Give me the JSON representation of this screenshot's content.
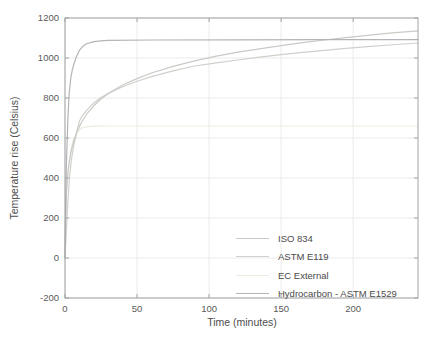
{
  "chart_data": {
    "type": "line",
    "title": "",
    "xlabel": "Time (minutes)",
    "ylabel": "Temperature rise (Celsius)",
    "xlim": [
      0,
      245
    ],
    "ylim": [
      -200,
      1200
    ],
    "xticks": [
      0,
      50,
      100,
      150,
      200
    ],
    "yticks": [
      -200,
      0,
      200,
      400,
      600,
      800,
      1000,
      1200
    ],
    "grid": true,
    "legend_position": "inside-bottom-right",
    "colors": {
      "axis": "#a3a3a3",
      "grid": "#ebebeb",
      "tick_label": "#5a5a5a",
      "axis_label": "#4d4d4d",
      "legend_text": "#4a4a4a",
      "background": "#ffffff"
    },
    "series": [
      {
        "name": "ISO 834",
        "color": "#c7cbc7",
        "points": [
          [
            0,
            0
          ],
          [
            0.5,
            195
          ],
          [
            1,
            329
          ],
          [
            1.5,
            384
          ],
          [
            2,
            425
          ],
          [
            3,
            482
          ],
          [
            4,
            525
          ],
          [
            5,
            556
          ],
          [
            6,
            583
          ],
          [
            8,
            625
          ],
          [
            10,
            658
          ],
          [
            12,
            685
          ],
          [
            15,
            719
          ],
          [
            20,
            761
          ],
          [
            25,
            795
          ],
          [
            30,
            822
          ],
          [
            40,
            865
          ],
          [
            50,
            897
          ],
          [
            60,
            925
          ],
          [
            75,
            958
          ],
          [
            90,
            986
          ],
          [
            105,
            1009
          ],
          [
            120,
            1029
          ],
          [
            135,
            1046
          ],
          [
            150,
            1062
          ],
          [
            165,
            1077
          ],
          [
            180,
            1090
          ],
          [
            195,
            1102
          ],
          [
            210,
            1113
          ],
          [
            225,
            1124
          ],
          [
            245,
            1136
          ]
        ]
      },
      {
        "name": "ASTM E119",
        "color": "#cfd1cb",
        "points": [
          [
            0,
            0
          ],
          [
            1,
            140
          ],
          [
            2,
            285
          ],
          [
            3,
            390
          ],
          [
            4,
            465
          ],
          [
            5,
            518
          ],
          [
            6,
            558
          ],
          [
            8,
            625
          ],
          [
            10,
            684
          ],
          [
            12,
            712
          ],
          [
            15,
            738
          ],
          [
            20,
            775
          ],
          [
            25,
            802
          ],
          [
            30,
            823
          ],
          [
            40,
            856
          ],
          [
            50,
            884
          ],
          [
            60,
            907
          ],
          [
            75,
            936
          ],
          [
            90,
            960
          ],
          [
            105,
            976
          ],
          [
            120,
            990
          ],
          [
            135,
            1004
          ],
          [
            150,
            1017
          ],
          [
            165,
            1028
          ],
          [
            180,
            1038
          ],
          [
            195,
            1048
          ],
          [
            210,
            1057
          ],
          [
            225,
            1065
          ],
          [
            245,
            1075
          ]
        ]
      },
      {
        "name": "EC External",
        "color": "#edebe1",
        "points": [
          [
            0,
            0
          ],
          [
            0.5,
            170
          ],
          [
            1,
            326
          ],
          [
            2,
            421
          ],
          [
            3,
            486
          ],
          [
            4,
            532
          ],
          [
            5,
            568
          ],
          [
            6,
            594
          ],
          [
            8,
            623
          ],
          [
            10,
            641
          ],
          [
            12,
            651
          ],
          [
            15,
            656
          ],
          [
            20,
            659
          ],
          [
            30,
            660
          ],
          [
            60,
            660
          ],
          [
            120,
            660
          ],
          [
            180,
            660
          ],
          [
            245,
            660
          ]
        ]
      },
      {
        "name": "Hydrocarbon - ASTM E1529",
        "color": "#b2b4b8",
        "points": [
          [
            0,
            0
          ],
          [
            0.5,
            290
          ],
          [
            1,
            470
          ],
          [
            1.5,
            590
          ],
          [
            2,
            700
          ],
          [
            2.5,
            770
          ],
          [
            3,
            830
          ],
          [
            4,
            900
          ],
          [
            5,
            938
          ],
          [
            6,
            965
          ],
          [
            8,
            1008
          ],
          [
            10,
            1038
          ],
          [
            12,
            1056
          ],
          [
            15,
            1071
          ],
          [
            20,
            1082
          ],
          [
            25,
            1086
          ],
          [
            30,
            1088
          ],
          [
            60,
            1090
          ],
          [
            120,
            1091
          ],
          [
            180,
            1092
          ],
          [
            245,
            1092
          ]
        ]
      }
    ]
  }
}
